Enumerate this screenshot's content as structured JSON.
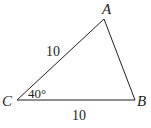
{
  "diagram": {
    "type": "triangle",
    "vertices": {
      "A": {
        "label": "A",
        "x": 104,
        "y": 19
      },
      "B": {
        "label": "B",
        "x": 135,
        "y": 100
      },
      "C": {
        "label": "C",
        "x": 17,
        "y": 100
      }
    },
    "sides": {
      "CA": {
        "label": "10"
      },
      "CB": {
        "label": "10"
      }
    },
    "angles": {
      "C": {
        "label": "40°"
      }
    },
    "stroke_color": "#231f20"
  }
}
